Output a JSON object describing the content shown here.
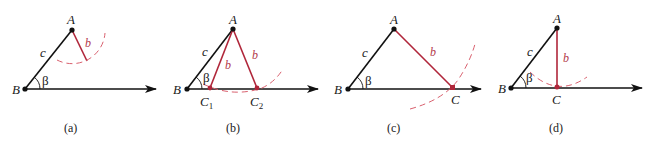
{
  "figure": {
    "colors": {
      "black": "#111111",
      "red_side": "#b0263a",
      "arc_dashed": "#d9606e",
      "red_label": "#b33a4a"
    },
    "panels": [
      {
        "id": "a",
        "caption": "(a)",
        "labels": {
          "A": "A",
          "B": "B",
          "c": "c",
          "b": "b",
          "beta": "β"
        },
        "description": "side b too short; arc does not reach ray — no triangle"
      },
      {
        "id": "b",
        "caption": "(b)",
        "labels": {
          "A": "A",
          "B": "B",
          "c": "c",
          "b1": "b",
          "b2": "b",
          "beta": "β",
          "C1": "C",
          "C1_sub": "1",
          "C2": "C",
          "C2_sub": "2"
        },
        "description": "arc meets ray twice — two triangles"
      },
      {
        "id": "c",
        "caption": "(c)",
        "labels": {
          "A": "A",
          "B": "B",
          "c": "c",
          "b": "b",
          "beta": "β",
          "C": "C"
        },
        "description": "arc meets ray once — one triangle"
      },
      {
        "id": "d",
        "caption": "(d)",
        "labels": {
          "A": "A",
          "B": "B",
          "c": "c",
          "b": "b",
          "beta": "β",
          "C": "C"
        },
        "description": "arc tangent to ray — one right triangle"
      }
    ]
  }
}
